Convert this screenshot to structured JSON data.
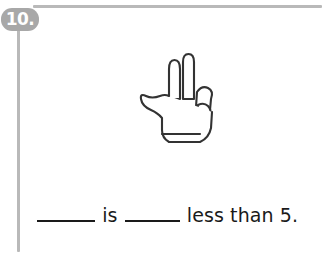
{
  "problem": {
    "number_label": "10.",
    "illustration": {
      "icon": "hand-two-fingers-up",
      "description": "Outline drawing of a hand showing two fingers extended",
      "fingers_extended": 2,
      "line_color": "#333333",
      "fill_color": "#ffffff"
    },
    "sentence": {
      "blank_1": "",
      "connector_word": "is",
      "blank_2": "",
      "phrase": "less than",
      "target_number": "5.",
      "full_text": "____ is ____ less than 5."
    }
  },
  "style": {
    "rule_color": "#b9b9b9",
    "badge_color": "#a8a8a8",
    "badge_text_color": "#ffffff",
    "text_color": "#1a1a1a",
    "background_color": "#ffffff"
  }
}
